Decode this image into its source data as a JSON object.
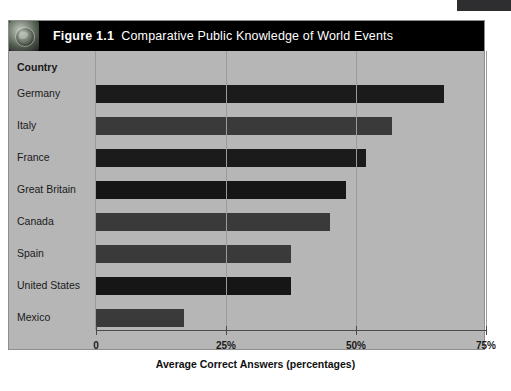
{
  "figure": {
    "number_label": "Figure 1.1",
    "title_text": "Comparative Public Knowledge of World Events",
    "icon": "globe-icon",
    "header_background": "#000000",
    "panel_background": "#b6b6b6"
  },
  "column_header": "Country",
  "axis": {
    "x_title": "Average Correct Answers (percentages)",
    "x_ticks": [
      "0",
      "25%",
      "50%",
      "75%"
    ],
    "x_tick_values": [
      0,
      25,
      50,
      75
    ]
  },
  "chart_data": {
    "type": "bar",
    "orientation": "horizontal",
    "categories": [
      "Germany",
      "Italy",
      "France",
      "Great Britain",
      "Canada",
      "Spain",
      "United States",
      "Mexico"
    ],
    "values": [
      67,
      57,
      52,
      48,
      45,
      37.5,
      37.5,
      17
    ],
    "xlabel": "Average Correct Answers (percentages)",
    "ylabel": "Country",
    "xlim": [
      0,
      75
    ],
    "xticks": [
      0,
      25,
      50,
      75
    ],
    "xticklabels": [
      "0",
      "25%",
      "50%",
      "75%"
    ],
    "grid": "vertical",
    "legend": "none",
    "bar_colors": [
      "#1b1b1b",
      "#3a3a3a",
      "#1b1b1b",
      "#161616",
      "#3a3a3a",
      "#3a3a3a",
      "#161616",
      "#3a3a3a"
    ]
  }
}
